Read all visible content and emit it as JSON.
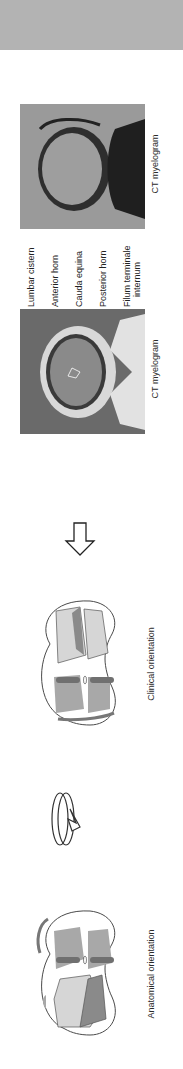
{
  "figure": {
    "panels": [
      {
        "id": "anatomical",
        "caption": "Anatomical orientation"
      },
      {
        "id": "rotation",
        "icon": "rotate-arrow-icon"
      },
      {
        "id": "clinical",
        "caption": "Clinical orientation"
      },
      {
        "id": "transition",
        "icon": "outline-arrow-icon"
      },
      {
        "id": "ct_left",
        "caption": "CT myelogram"
      },
      {
        "id": "ct_right",
        "caption": "CT myelogram"
      }
    ],
    "ct_labels": [
      "Lumbar cistern",
      "Anterior horn",
      "Cauda equina",
      "Posterior horn",
      "Filum terminale",
      "internum"
    ],
    "colors": {
      "header_band": "#b3b3b3",
      "white_matter": "#ffffff",
      "gray_matter": "#a8a8a8",
      "dark_gray": "#7c7c7c",
      "light_gray": "#d9d9d9",
      "outline": "#4a4a4a"
    }
  }
}
